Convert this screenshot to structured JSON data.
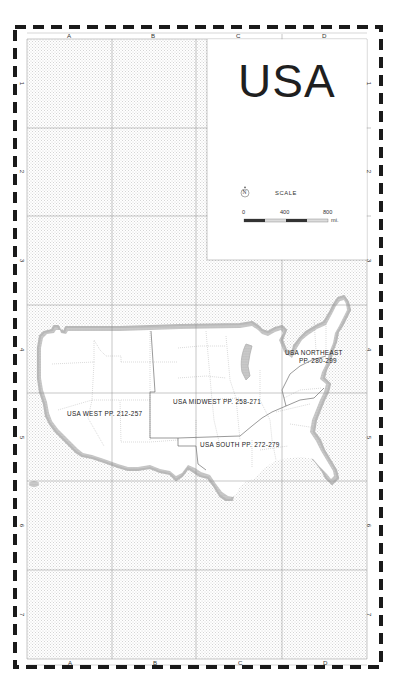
{
  "map": {
    "title": "USA",
    "columns": [
      "A",
      "B",
      "C",
      "D"
    ],
    "rows": [
      "1",
      "2",
      "3",
      "4",
      "5",
      "6",
      "7"
    ],
    "north_arrow": "N",
    "scale": {
      "label": "SCALE",
      "ticks": [
        "0",
        "400",
        "800"
      ],
      "unit": "mi."
    },
    "regions": [
      {
        "name": "USA WEST",
        "pages": "PP. 212-257",
        "text": "USA WEST PP. 212-257"
      },
      {
        "name": "USA MIDWEST",
        "pages": "PP. 258-271",
        "text": "USA MIDWEST PP. 258-271"
      },
      {
        "name": "USA SOUTH",
        "pages": "PP. 272-279",
        "text": "USA SOUTH PP. 272-279"
      },
      {
        "name": "USA NORTHEAST",
        "pages": "PP. 280-299",
        "line1": "USA NORTHEAST",
        "line2": "PP. 280-299"
      }
    ],
    "colors": {
      "border": "#1a1a1a",
      "grid": "#8a8a8a",
      "sea_dots": "#b5b5b5",
      "coast": "#a8a8a8",
      "land": "#ffffff"
    }
  }
}
